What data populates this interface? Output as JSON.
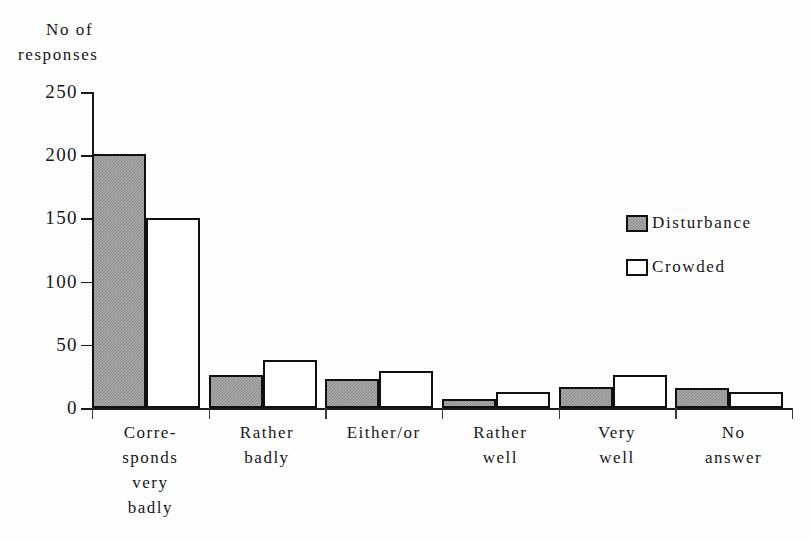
{
  "chart_data": {
    "type": "bar",
    "title": "",
    "xlabel": "",
    "ylabel": "No of responses",
    "ylabel_lines": [
      "No of",
      "responses"
    ],
    "ylim": [
      0,
      250
    ],
    "yticks": [
      250,
      200,
      150,
      100,
      50,
      0
    ],
    "grid": false,
    "legend_position": "right",
    "categories": [
      "Corresponds very badly",
      "Rather badly",
      "Either/or",
      "Rather well",
      "Very well",
      "No answer"
    ],
    "category_label_lines": [
      [
        "Corre-",
        "sponds",
        "very",
        "badly"
      ],
      [
        "Rather",
        "badly"
      ],
      [
        "Either/or"
      ],
      [
        "Rather",
        "well"
      ],
      [
        "Very",
        "well"
      ],
      [
        "No",
        "answer"
      ]
    ],
    "series": [
      {
        "name": "Disturbance",
        "fill": "#a9a9a9",
        "style": "dithered-gray",
        "values": [
          201,
          26,
          23,
          7,
          17,
          16
        ]
      },
      {
        "name": "Crowded",
        "fill": "#ffffff",
        "style": "white-outline",
        "values": [
          150,
          38,
          29,
          13,
          26,
          13
        ]
      }
    ]
  },
  "legend": {
    "items": [
      {
        "label": "Disturbance",
        "swatch": "series-disturbance"
      },
      {
        "label": "Crowded",
        "swatch": "series-crowded"
      }
    ]
  },
  "colors": {
    "axis": "#1a1a1a",
    "bar_outline": "#101010",
    "disturbance_fill": "#a9a9a9",
    "crowded_fill": "#ffffff",
    "background": "#fefefe"
  }
}
